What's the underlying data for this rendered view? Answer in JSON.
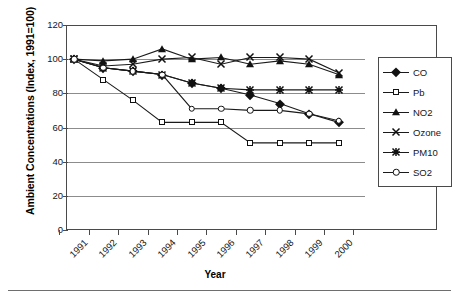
{
  "chart_data": {
    "type": "line",
    "title": "",
    "xlabel": "Year",
    "ylabel": "Ambient Concentrations (Index, 1991=100)",
    "categories": [
      "1991",
      "1992",
      "1993",
      "1994",
      "1995",
      "1996",
      "1997",
      "1998",
      "1999",
      "2000"
    ],
    "ylim": [
      0,
      120
    ],
    "ytick_labels": [
      "0",
      "20",
      "40",
      "60",
      "80",
      "100",
      "120"
    ],
    "ytick_values": [
      0,
      20,
      40,
      60,
      80,
      100,
      120
    ],
    "grid": true,
    "legend_position": "right",
    "series": [
      {
        "name": "CO",
        "marker": "filled-diamond",
        "values": [
          100,
          95,
          93,
          91,
          86,
          83,
          79,
          74,
          68,
          63
        ]
      },
      {
        "name": "Pb",
        "marker": "open-square",
        "values": [
          100,
          88,
          76,
          63,
          63,
          63,
          51,
          51,
          51,
          51
        ]
      },
      {
        "name": "NO2",
        "marker": "filled-triangle",
        "values": [
          100,
          99,
          100,
          106,
          100,
          101,
          97,
          99,
          97,
          91
        ]
      },
      {
        "name": "Ozone",
        "marker": "x-cross",
        "values": [
          100,
          96,
          97,
          100,
          101,
          97,
          101,
          101,
          100,
          92
        ]
      },
      {
        "name": "PM10",
        "marker": "asterisk",
        "values": [
          100,
          95,
          93,
          91,
          86,
          83,
          82,
          82,
          82,
          82
        ]
      },
      {
        "name": "SO2",
        "marker": "open-circle",
        "values": [
          100,
          95,
          93,
          91,
          71,
          71,
          70,
          70,
          68,
          64
        ]
      }
    ],
    "colors": {
      "line": "#1a1a1a",
      "grid": "#8c8c8c",
      "axis": "#4a4a4a",
      "background": "#ffffff"
    }
  },
  "legend": {
    "items": [
      {
        "label": "CO",
        "marker": "filled-diamond"
      },
      {
        "label": "Pb",
        "marker": "open-square"
      },
      {
        "label": "NO2",
        "marker": "filled-triangle"
      },
      {
        "label": "Ozone",
        "marker": "x-cross"
      },
      {
        "label": "PM10",
        "marker": "asterisk"
      },
      {
        "label": "SO2",
        "marker": "open-circle"
      }
    ]
  }
}
